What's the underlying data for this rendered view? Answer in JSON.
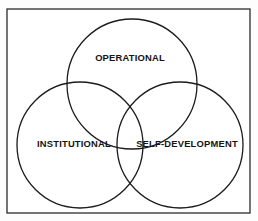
{
  "diagram": {
    "type": "venn-three-circle",
    "title": "",
    "background_color": "#fdfdfd",
    "panel_color": "#ffffff",
    "frame": {
      "name": "outer-border",
      "x": 7,
      "y": 9,
      "width": 243,
      "height": 204,
      "stroke_color": "#2b2b2b",
      "stroke_width": 1.3
    },
    "stroke_color": "#1c1c1c",
    "stroke_width": 1.3,
    "text_color": "#141414",
    "sets": [
      {
        "id": "operational",
        "label": "OPERATIONAL",
        "cx": 132,
        "cy": 84,
        "r": 65,
        "label_x": 130,
        "label_y": 59,
        "font_size": 9.4
      },
      {
        "id": "institutional",
        "label": "INSTITUTIONAL",
        "cx": 80,
        "cy": 145,
        "r": 63,
        "label_x": 74,
        "label_y": 145,
        "font_size": 9.4
      },
      {
        "id": "self-development",
        "label": "SELF-DEVELOPMENT",
        "cx": 180,
        "cy": 145,
        "r": 63,
        "label_x": 187,
        "label_y": 145,
        "font_size": 9.4
      }
    ]
  }
}
